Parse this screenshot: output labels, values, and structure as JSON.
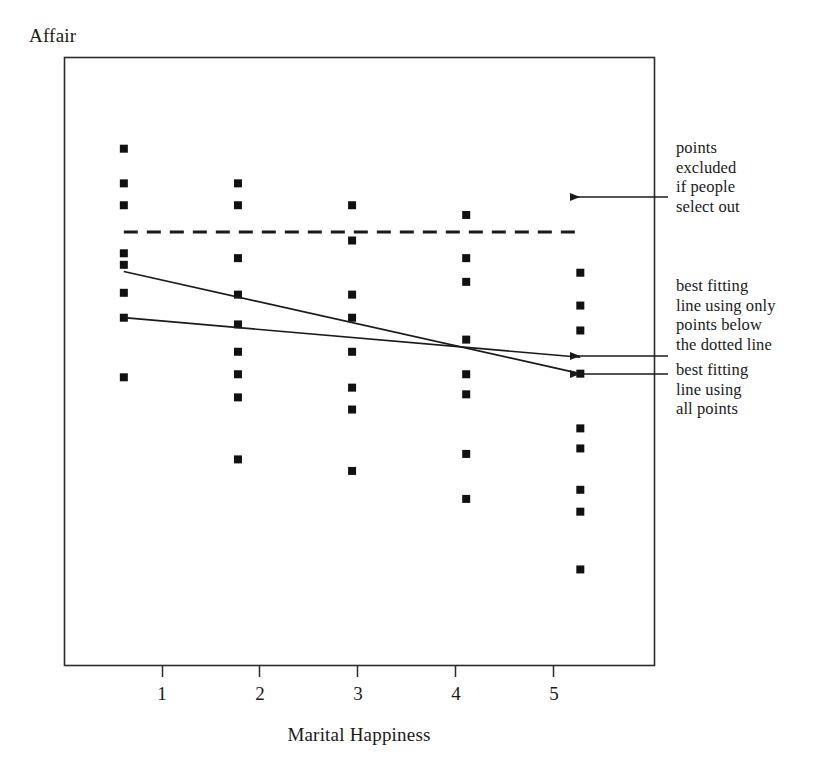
{
  "figure": {
    "ylabel": "Affair",
    "xlabel": "Marital Happiness",
    "tick_labels": [
      "1",
      "2",
      "3",
      "4",
      "5"
    ],
    "annotations": [
      "points\nexcluded\nif people\nselect out",
      "best fitting\nline using only\npoints below\nthe dotted line",
      "best fitting\nline using\nall points"
    ]
  },
  "chart_data": {
    "type": "scatter",
    "title": "",
    "xlabel": "Marital Happiness",
    "ylabel": "Affair",
    "xlim": [
      0.48,
      5.65
    ],
    "ylim": [
      0,
      10
    ],
    "xticks": [
      1,
      2,
      3,
      4,
      5
    ],
    "xtick_labels": [
      "1",
      "2",
      "3",
      "4",
      "5"
    ],
    "yticks": [],
    "ytick_labels": [],
    "grid": false,
    "legend": null,
    "frame": "box",
    "marker": "square",
    "marker_color": "#111111",
    "points": [
      {
        "x": 1,
        "y": 8.5
      },
      {
        "x": 1,
        "y": 7.93
      },
      {
        "x": 1,
        "y": 7.57
      },
      {
        "x": 1,
        "y": 6.78
      },
      {
        "x": 1,
        "y": 6.59
      },
      {
        "x": 1,
        "y": 6.13
      },
      {
        "x": 1,
        "y": 5.72
      },
      {
        "x": 1,
        "y": 4.74
      },
      {
        "x": 2,
        "y": 7.93
      },
      {
        "x": 2,
        "y": 7.57
      },
      {
        "x": 2,
        "y": 6.7
      },
      {
        "x": 2,
        "y": 6.1
      },
      {
        "x": 2,
        "y": 5.61
      },
      {
        "x": 2,
        "y": 5.16
      },
      {
        "x": 2,
        "y": 4.79
      },
      {
        "x": 2,
        "y": 4.41
      },
      {
        "x": 2,
        "y": 3.39
      },
      {
        "x": 3,
        "y": 7.57
      },
      {
        "x": 3,
        "y": 6.99
      },
      {
        "x": 3,
        "y": 6.1
      },
      {
        "x": 3,
        "y": 5.72
      },
      {
        "x": 3,
        "y": 5.16
      },
      {
        "x": 3,
        "y": 4.57
      },
      {
        "x": 3,
        "y": 4.21
      },
      {
        "x": 3,
        "y": 3.2
      },
      {
        "x": 4,
        "y": 7.41
      },
      {
        "x": 4,
        "y": 6.7
      },
      {
        "x": 4,
        "y": 6.31
      },
      {
        "x": 4,
        "y": 5.36
      },
      {
        "x": 4,
        "y": 4.79
      },
      {
        "x": 4,
        "y": 4.46
      },
      {
        "x": 4,
        "y": 3.48
      },
      {
        "x": 4,
        "y": 2.74
      },
      {
        "x": 5,
        "y": 6.46
      },
      {
        "x": 5,
        "y": 5.92
      },
      {
        "x": 5,
        "y": 5.51
      },
      {
        "x": 5,
        "y": 4.8
      },
      {
        "x": 5,
        "y": 3.9
      },
      {
        "x": 5,
        "y": 3.57
      },
      {
        "x": 5,
        "y": 2.89
      },
      {
        "x": 5,
        "y": 2.53
      },
      {
        "x": 5,
        "y": 1.58
      }
    ],
    "reference_line": {
      "name": "selection threshold",
      "style": "dashed",
      "orientation": "horizontal",
      "y": 7.13,
      "x_start": 1.0,
      "x_end": 5.0
    },
    "fit_lines": [
      {
        "name": "best fitting line using all points",
        "style": "solid",
        "x_start": 1.0,
        "y_start": 6.48,
        "x_end": 5.0,
        "y_end": 4.8
      },
      {
        "name": "best fitting line using only points below the dotted line",
        "style": "solid",
        "x_start": 1.0,
        "y_start": 5.72,
        "x_end": 5.0,
        "y_end": 5.07
      }
    ],
    "annotation_arrows": [
      {
        "label": "points excluded if people select out",
        "points_to": "dashed reference line"
      },
      {
        "label": "best fitting line using only points below the dotted line",
        "points_to": "flatter fit line"
      },
      {
        "label": "best fitting line using all points",
        "points_to": "steeper fit line"
      }
    ]
  }
}
